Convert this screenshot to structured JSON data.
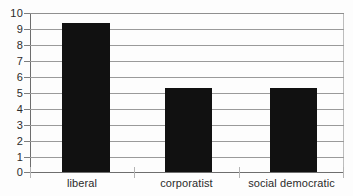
{
  "chart_data": {
    "type": "bar",
    "title": "",
    "subtitle": "",
    "xlabel": "",
    "ylabel": "",
    "categories": [
      "liberal",
      "corporatist",
      "social democratic"
    ],
    "values": [
      9.4,
      5.3,
      5.3
    ],
    "series": [
      {
        "name": "",
        "values": [
          9.4,
          5.3,
          5.3
        ]
      }
    ],
    "ylim": [
      0,
      10
    ],
    "y_ticks": [
      0,
      1,
      2,
      3,
      4,
      5,
      6,
      7,
      8,
      9,
      10
    ],
    "y_tick_labels": [
      "0",
      "1",
      "2",
      "3",
      "4",
      "5",
      "6",
      "7",
      "8",
      "9",
      "10"
    ],
    "grid": true,
    "grid_axis": "y",
    "legend": false,
    "legend_position": "none",
    "annotations": [],
    "colors": {
      "bar_fill": "#111111",
      "gridline": "#9a9a9a",
      "axis_line": "#6e6e6e",
      "text": "#2b2b2b",
      "background": "#fdfdfd"
    }
  }
}
